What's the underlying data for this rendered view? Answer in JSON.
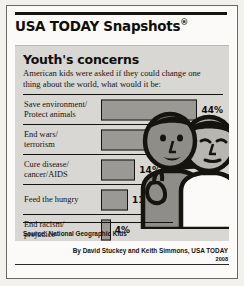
{
  "masthead": {
    "brand": "USA TODAY Snapshots",
    "registered_mark": "®"
  },
  "panel": {
    "headline": "Youth's concerns",
    "subtitle": "American kids were asked if they could change one thing about the world, what would it be:",
    "source": "Source: National Geographic Kids"
  },
  "byline": {
    "credit": "By David Stuckey and Keith Simmons, USA TODAY",
    "year": "2008"
  },
  "colors": {
    "page_background": "#f2f1ee",
    "panel_background": "#d9d7d3",
    "bar_fill": "#9b9995",
    "ink": "#15130f",
    "kid_left_fill": "#8f8d89",
    "kid_right_fill": "#fbfaf8"
  },
  "chart_data": {
    "type": "bar",
    "orientation": "horizontal",
    "title": "Youth's concerns",
    "subtitle": "American kids were asked if they could change one thing about the world, what would it be:",
    "xlabel": "",
    "ylabel": "",
    "xlim": [
      0,
      50
    ],
    "grid": false,
    "legend": "none",
    "value_suffix": "%",
    "source": "Source: National Geographic Kids",
    "categories": [
      "Save environment/\nProtect animals",
      "End wars/\nterrorism",
      "Cure disease/\ncancer/AIDS",
      "Feed the hungry",
      "End racism/\nprejudice"
    ],
    "values": [
      44,
      21,
      14,
      11,
      4
    ],
    "labels": [
      "44%",
      "21%",
      "14%",
      "11%",
      "4%"
    ],
    "rows": [
      {
        "line1": "Save environment/",
        "line2": "Protect animals",
        "value": 44,
        "label": "44%"
      },
      {
        "line1": "End wars/",
        "line2": "terrorism",
        "value": 21,
        "label": "21%"
      },
      {
        "line1": "Cure disease/",
        "line2": "cancer/AIDS",
        "value": 14,
        "label": "14%"
      },
      {
        "line1": "Feed the hungry",
        "line2": "",
        "value": 11,
        "label": "11%"
      },
      {
        "line1": "End racism/",
        "line2": "prejudice",
        "value": 4,
        "label": "4%"
      }
    ]
  }
}
